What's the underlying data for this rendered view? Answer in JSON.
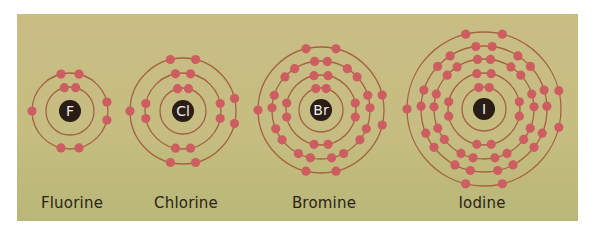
{
  "colors": {
    "background": "#c6bd82",
    "ring": "#a5623e",
    "electron": "#cd5d61",
    "nucleus": "#2a1d16",
    "nucleus_text": "#f3ede4",
    "label_text": "#2a2418"
  },
  "atoms": [
    {
      "name": "Fluorine",
      "symbol": "F",
      "cx": 70,
      "cy": 111,
      "label_x": 72,
      "shells": [
        2,
        7
      ],
      "radii": [
        24,
        38
      ]
    },
    {
      "name": "Chlorine",
      "symbol": "Cl",
      "cx": 183,
      "cy": 111,
      "label_x": 186,
      "shells": [
        2,
        8,
        7
      ],
      "radii": [
        23,
        38,
        53
      ]
    },
    {
      "name": "Bromine",
      "symbol": "Br",
      "cx": 321,
      "cy": 110,
      "label_x": 324,
      "shells": [
        2,
        8,
        18,
        7
      ],
      "radii": [
        22,
        35,
        49,
        63
      ]
    },
    {
      "name": "Iodine",
      "symbol": "I",
      "cx": 484,
      "cy": 109,
      "label_x": 482,
      "shells": [
        2,
        8,
        18,
        18,
        7
      ],
      "radii": [
        22,
        36,
        50,
        63,
        77
      ]
    }
  ]
}
